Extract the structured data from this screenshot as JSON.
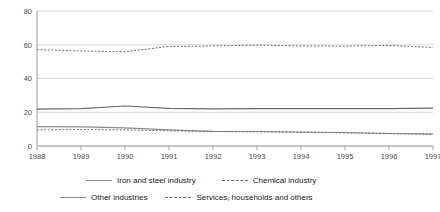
{
  "chart_data": {
    "type": "line",
    "title": "",
    "xlabel": "",
    "ylabel": "",
    "categories": [
      "1988",
      "1989",
      "1990",
      "1991",
      "1992",
      "1993",
      "1994",
      "1995",
      "1996",
      "1997"
    ],
    "x": [
      1988,
      1989,
      1990,
      1991,
      1992,
      1993,
      1994,
      1995,
      1996,
      1997
    ],
    "ylim": [
      0,
      80
    ],
    "yticks": [
      0,
      20,
      40,
      60,
      80
    ],
    "ytick_labels": [
      "0",
      "20",
      "40",
      "60",
      "80"
    ],
    "grid": true,
    "grid_axis": "y",
    "legend_position": "bottom",
    "legend_columns": 2,
    "series": [
      {
        "name": "Iron and steel industry",
        "style": "solid",
        "color": "#8c8c8c",
        "values": [
          11.5,
          11.3,
          10.8,
          9.6,
          8.7,
          8.6,
          8.3,
          8.0,
          7.4,
          7.0
        ]
      },
      {
        "name": "Chemical industry",
        "style": "dashed",
        "color": "#6f6f6f",
        "values": [
          9.6,
          9.7,
          9.6,
          9.0,
          8.6,
          8.4,
          8.1,
          7.8,
          7.4,
          7.1
        ]
      },
      {
        "name": "Other industries",
        "style": "solid",
        "color": "#6b6b6b",
        "values": [
          21.8,
          22.2,
          23.7,
          22.3,
          22.0,
          22.1,
          22.1,
          22.1,
          22.2,
          22.5
        ]
      },
      {
        "name": "Services, households and others",
        "style": "dashed",
        "color": "#6f6f6f",
        "values": [
          57.1,
          56.3,
          55.9,
          59.0,
          59.3,
          59.8,
          59.3,
          59.2,
          59.6,
          58.4
        ]
      }
    ]
  },
  "legend": {
    "entries": [
      {
        "label": "Iron and steel industry",
        "style": "solid"
      },
      {
        "label": "Chemical industry",
        "style": "dashed"
      },
      {
        "label": "Other industries",
        "style": "solid"
      },
      {
        "label": "Services, households and others",
        "style": "dashed"
      }
    ]
  },
  "axes": {
    "y_tick_0": "0",
    "y_tick_1": "20",
    "y_tick_2": "40",
    "y_tick_3": "60",
    "y_tick_4": "80",
    "x_tick_0": "1988",
    "x_tick_1": "1989",
    "x_tick_2": "1990",
    "x_tick_3": "1991",
    "x_tick_4": "1992",
    "x_tick_5": "1993",
    "x_tick_6": "1994",
    "x_tick_7": "1995",
    "x_tick_8": "1996",
    "x_tick_9": "1997"
  },
  "colors": {
    "gridline": "#d9d9d9",
    "axis": "#9a9a9a",
    "tick_text": "#4a4a4a",
    "legend_text": "#1b1b1b",
    "background": "#ffffff"
  }
}
